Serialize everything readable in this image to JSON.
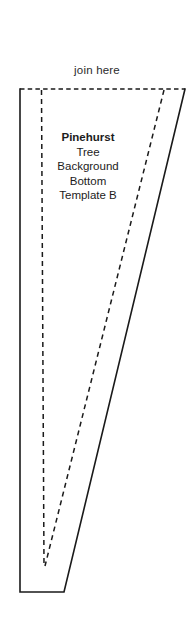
{
  "sheet": {
    "name": "pattern-template-piece",
    "background_color": "#ffffff",
    "line_color": "#1a1a1a",
    "width": 194,
    "height": 641
  },
  "labels": {
    "join_here": "join here"
  },
  "caption": {
    "lines": [
      "Pinehurst",
      "Tree",
      "Background",
      "Bottom",
      "Template B"
    ],
    "line_0": "Pinehurst",
    "line_1": "Tree",
    "line_2": "Background",
    "line_3": "Bottom",
    "line_4": "Template B"
  },
  "geometry": {
    "solid_outline": "M20,89 L185,89 L64,592 L20,592 Z",
    "dashed_top_edge": "M20,89 L185,89",
    "dashed_vertical_fold": "M41.5,89 L44,565",
    "dashed_slanted_fold": "M164,89 L45,565",
    "notes": "Tapered quadrilateral pattern piece with dashed fold/seam guides"
  }
}
